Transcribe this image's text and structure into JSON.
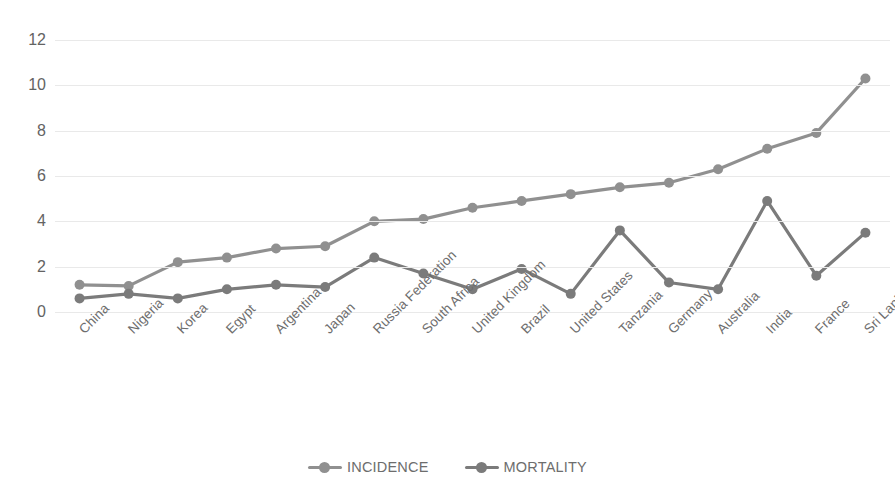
{
  "chart_data": {
    "type": "line",
    "title": "",
    "xlabel": "",
    "ylabel": "",
    "ylim": [
      0,
      12
    ],
    "yticks": [
      0,
      2,
      4,
      6,
      8,
      10,
      12
    ],
    "grid": true,
    "legend_position": "bottom",
    "categories": [
      "China",
      "Nigeria",
      "Korea",
      "Egypt",
      "Argentina",
      "Japan",
      "Russia Federation",
      "South Africa",
      "United Kingdom",
      "Brazil",
      "United States",
      "Tanzania",
      "Germany",
      "Australia",
      "India",
      "France",
      "Sri Lanka"
    ],
    "series": [
      {
        "name": "INCIDENCE",
        "color": "#909090",
        "values": [
          1.2,
          1.15,
          2.2,
          2.4,
          2.8,
          2.9,
          4.0,
          4.1,
          4.6,
          4.9,
          5.2,
          5.5,
          5.7,
          6.3,
          7.2,
          7.9,
          10.3
        ]
      },
      {
        "name": "MORTALITY",
        "color": "#7b7b7b",
        "values": [
          0.6,
          0.8,
          0.6,
          1.0,
          1.2,
          1.1,
          2.4,
          1.7,
          1.0,
          1.9,
          0.8,
          3.6,
          1.3,
          1.0,
          4.9,
          1.6,
          3.5
        ]
      }
    ]
  },
  "legend": {
    "items": [
      {
        "label": "INCIDENCE",
        "color": "#909090"
      },
      {
        "label": "MORTALITY",
        "color": "#7b7b7b"
      }
    ]
  },
  "axes": {
    "y_tick_labels": [
      "12",
      "10",
      "8",
      "6",
      "4",
      "2",
      "0"
    ],
    "grid_color": "#e9e9e9",
    "tick_text_color": "#636363"
  }
}
